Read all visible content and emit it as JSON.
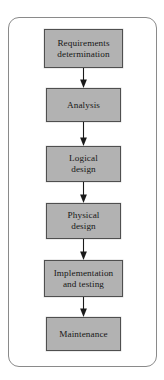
{
  "diagram": {
    "type": "vertical-flowchart",
    "orientation": "top-to-bottom",
    "colors": {
      "node_fill": "#b2b2b2",
      "node_border": "#4f4f4f",
      "node_text": "#171717",
      "frame_border": "#8a8a8a",
      "background": "#ffffff",
      "arrow": "#1a1a1a"
    },
    "frame": {
      "shape": "rounded-rectangle",
      "corner_radius": "11px"
    },
    "nodes": [
      {
        "id": "requirements-determination",
        "label": "Requirements\ndetermination",
        "order": 1
      },
      {
        "id": "analysis",
        "label": "Analysis",
        "order": 2
      },
      {
        "id": "logical-design",
        "label": "Logical\ndesign",
        "order": 3
      },
      {
        "id": "physical-design",
        "label": "Physical\ndesign",
        "order": 4
      },
      {
        "id": "implementation-and-testing",
        "label": "Implementation\nand testing",
        "order": 5
      },
      {
        "id": "maintenance",
        "label": "Maintenance",
        "order": 6
      }
    ],
    "connectors": [
      {
        "id": "arrow-1",
        "from": "requirements-determination",
        "to": "analysis",
        "style": "solid-arrow-down"
      },
      {
        "id": "arrow-2",
        "from": "analysis",
        "to": "logical-design",
        "style": "solid-arrow-down"
      },
      {
        "id": "arrow-3",
        "from": "logical-design",
        "to": "physical-design",
        "style": "solid-arrow-down"
      },
      {
        "id": "arrow-4",
        "from": "physical-design",
        "to": "implementation-and-testing",
        "style": "solid-arrow-down"
      },
      {
        "id": "arrow-5",
        "from": "implementation-and-testing",
        "to": "maintenance",
        "style": "solid-arrow-down"
      }
    ]
  }
}
